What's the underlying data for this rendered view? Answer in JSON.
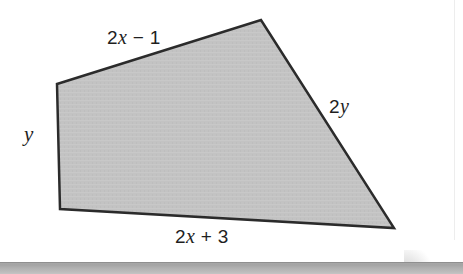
{
  "figure": {
    "kind": "geometry-figure",
    "shape_name": "quadrilateral",
    "fill_color": "#c3c3c3",
    "stroke_color": "#2b2b2b",
    "stroke_width": 2.5,
    "vertices": [
      {
        "name": "top-left",
        "x": 57,
        "y": 84
      },
      {
        "name": "top-right",
        "x": 261,
        "y": 20
      },
      {
        "name": "bottom-right",
        "x": 394,
        "y": 228
      },
      {
        "name": "bottom-left",
        "x": 60,
        "y": 209
      }
    ],
    "labels": {
      "top": {
        "text": "2x − 1",
        "coefficient": "2",
        "variable": "x",
        "operator": "−",
        "constant": "1"
      },
      "right": {
        "text": "2y",
        "coefficient": "2",
        "variable": "y",
        "operator": "",
        "constant": ""
      },
      "bottom": {
        "text": "2x + 3",
        "coefficient": "2",
        "variable": "x",
        "operator": "+",
        "constant": "3"
      },
      "left": {
        "text": "y",
        "coefficient": "",
        "variable": "y",
        "operator": "",
        "constant": ""
      }
    }
  },
  "page": {
    "background_color": "#ffffff",
    "shadow_band_color": "#a8a8a8",
    "edge_rule_color": "#ededed"
  }
}
